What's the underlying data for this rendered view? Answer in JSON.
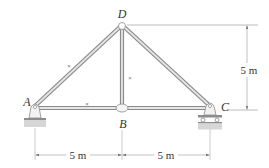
{
  "diagram": {
    "type": "truss",
    "joints": [
      {
        "id": "A",
        "label": "A",
        "x": 35,
        "y": 108,
        "support": "pin"
      },
      {
        "id": "B",
        "label": "B",
        "x": 122,
        "y": 108,
        "support": "none"
      },
      {
        "id": "C",
        "label": "C",
        "x": 210,
        "y": 108,
        "support": "roller"
      },
      {
        "id": "D",
        "label": "D",
        "x": 122,
        "y": 25,
        "support": "none"
      }
    ],
    "members": [
      {
        "from": "A",
        "to": "D"
      },
      {
        "from": "D",
        "to": "C"
      },
      {
        "from": "D",
        "to": "B"
      },
      {
        "from": "A",
        "to": "B"
      },
      {
        "from": "B",
        "to": "C"
      }
    ],
    "dimensions": {
      "height": "5 m",
      "span_left": "5 m",
      "span_right": "5 m"
    },
    "markers": [
      "×",
      "×",
      "×"
    ],
    "colors": {
      "member": "#9a9a9a",
      "member_highlight": "#e8e8e8",
      "ground": "#cfcfcf",
      "text": "#333333"
    }
  }
}
